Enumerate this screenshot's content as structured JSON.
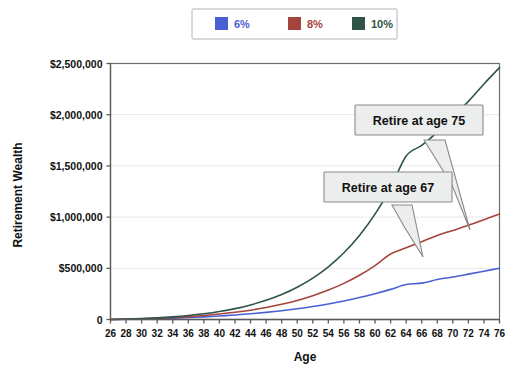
{
  "chart_data": {
    "type": "line",
    "title": "",
    "xlabel": "Age",
    "ylabel": "Retirement Wealth",
    "xlim": [
      26,
      76
    ],
    "ylim": [
      0,
      2500000
    ],
    "grid": true,
    "legend_position": "top-center",
    "x_tick_labels": [
      "26",
      "28",
      "30",
      "32",
      "34",
      "36",
      "38",
      "40",
      "42",
      "44",
      "46",
      "48",
      "50",
      "52",
      "54",
      "56",
      "58",
      "60",
      "62",
      "64",
      "66",
      "68",
      "70",
      "72",
      "74",
      "76"
    ],
    "y_tick_labels": [
      "0",
      "$500,000",
      "$1,000,000",
      "$1,500,000",
      "$2,000,000",
      "$2,500,000"
    ],
    "y_tick_values": [
      0,
      500000,
      1000000,
      1500000,
      2000000,
      2500000
    ],
    "x": [
      26,
      28,
      30,
      32,
      34,
      36,
      38,
      40,
      42,
      44,
      46,
      48,
      50,
      52,
      54,
      56,
      58,
      60,
      62,
      64,
      66,
      68,
      70,
      72,
      74,
      76
    ],
    "series": [
      {
        "name": "6%",
        "color": "#4a5fd4",
        "values": [
          0,
          13000,
          28000,
          45000,
          64000,
          86000,
          110000,
          137000,
          168000,
          203000,
          242000,
          286000,
          336000,
          392000,
          455000,
          527000,
          607000,
          697000,
          799000,
          913000,
          1041000,
          1185000,
          1348000,
          1531000,
          1737000,
          1969000
        ]
      },
      {
        "name": "8%",
        "color": "#a5443a",
        "values": [
          0,
          13500,
          29500,
          48500,
          71000,
          97500,
          128500,
          165000,
          207500,
          257500,
          316500,
          385500,
          466000,
          560000,
          670000,
          799000,
          950000,
          1126000,
          1333000,
          1574000,
          1857000,
          2188000,
          2575000,
          3028000,
          3559000,
          4180000
        ]
      },
      {
        "name": "10%",
        "color": "#2d5446",
        "values": [
          0,
          14000,
          31000,
          51500,
          76500,
          106500,
          143000,
          187500,
          241500,
          307000,
          386500,
          482500,
          599000,
          740000,
          911000,
          1118000,
          1368000,
          1671000,
          2038000,
          2481000,
          3018000,
          3667000,
          4452000,
          5402000,
          6552000,
          7944000
        ]
      }
    ],
    "series_display": [
      {
        "name": "6%",
        "color": "#4a5fd4",
        "plotted_values": [
          0,
          2000,
          5000,
          9000,
          13000,
          19000,
          26000,
          34000,
          44000,
          56000,
          70000,
          86000,
          105000,
          127000,
          152000,
          181000,
          214000,
          252000,
          294000,
          342000,
          355000,
          390000,
          415000,
          443000,
          472000,
          500000
        ]
      },
      {
        "name": "8%",
        "color": "#a5443a",
        "plotted_values": [
          0,
          3000,
          7000,
          12000,
          19000,
          28000,
          39000,
          53000,
          70000,
          91000,
          117000,
          148000,
          186000,
          232000,
          287000,
          353000,
          432000,
          527000,
          640000,
          700000,
          760000,
          820000,
          870000,
          920000,
          975000,
          1030000
        ]
      },
      {
        "name": "10%",
        "color": "#2d5446",
        "plotted_values": [
          0,
          4000,
          9000,
          16000,
          26000,
          39000,
          56000,
          78000,
          106000,
          142000,
          187000,
          244000,
          315000,
          404000,
          515000,
          652000,
          821000,
          1029000,
          1284000,
          1596000,
          1700000,
          1830000,
          1980000,
          2130000,
          2300000,
          2460000
        ]
      }
    ],
    "annotations": [
      {
        "id": "callout-75",
        "label": "Retire at age 75",
        "target_series": "10%",
        "target_age": 75
      },
      {
        "id": "callout-67",
        "label": "Retire at age 67",
        "target_series": "10%",
        "target_age": 67
      }
    ],
    "legend_entries": [
      {
        "label": "6%",
        "color": "#4a5fd4"
      },
      {
        "label": "8%",
        "color": "#a5443a"
      },
      {
        "label": "10%",
        "color": "#2d5446"
      }
    ]
  }
}
